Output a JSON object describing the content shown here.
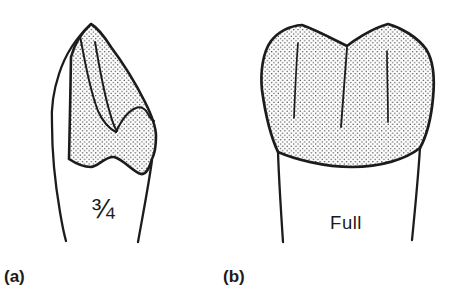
{
  "figure": {
    "background_color": "#ffffff",
    "ink_color": "#1c1c1c",
    "stipple_dot_color": "#3c3c3c",
    "panels": [
      {
        "crown_label": "¾",
        "caption": "(a)"
      },
      {
        "crown_label": "Full",
        "caption": "(b)"
      }
    ]
  }
}
